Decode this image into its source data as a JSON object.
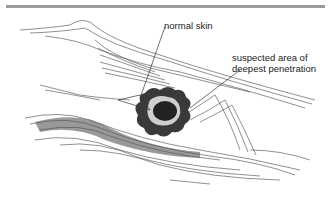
{
  "figure": {
    "type": "medical illustration",
    "labels": {
      "normal_skin": "normal skin",
      "deepest_penetration_line1": "suspected area of",
      "deepest_penetration_line2": "deepest penetration"
    },
    "colors": {
      "ink": "#222222",
      "rule": "#9a9a9a",
      "background": "#ffffff"
    }
  }
}
